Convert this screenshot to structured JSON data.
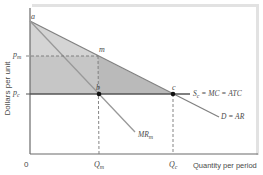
{
  "diagram": {
    "axes": {
      "y_label": "Dollars per unit",
      "x_label": "Quantity per period",
      "origin": "0"
    },
    "price_labels": {
      "pm": {
        "main": "p",
        "sub": "m"
      },
      "pc": {
        "main": "p",
        "sub": "c"
      }
    },
    "quantity_labels": {
      "qm": {
        "main": "Q",
        "sub": "m"
      },
      "qc": {
        "main": "Q",
        "sub": "c"
      }
    },
    "points": {
      "a": "a",
      "m": "m",
      "b": "b",
      "c": "c"
    },
    "curves": {
      "supply": {
        "s": "S",
        "s_sub": "c",
        "rest": " = MC = ATC"
      },
      "demand": "D = AR",
      "mr": {
        "main": "MR",
        "sub": "m"
      }
    },
    "colors": {
      "axis": "#6b6b6b",
      "curve": "#8a8a8a",
      "supply_line": "#555555",
      "upper_triangle": "#d6d6d6",
      "lower_rect": "#a8a8a8",
      "frame": "#dcdcdc",
      "point": "#111111"
    }
  }
}
